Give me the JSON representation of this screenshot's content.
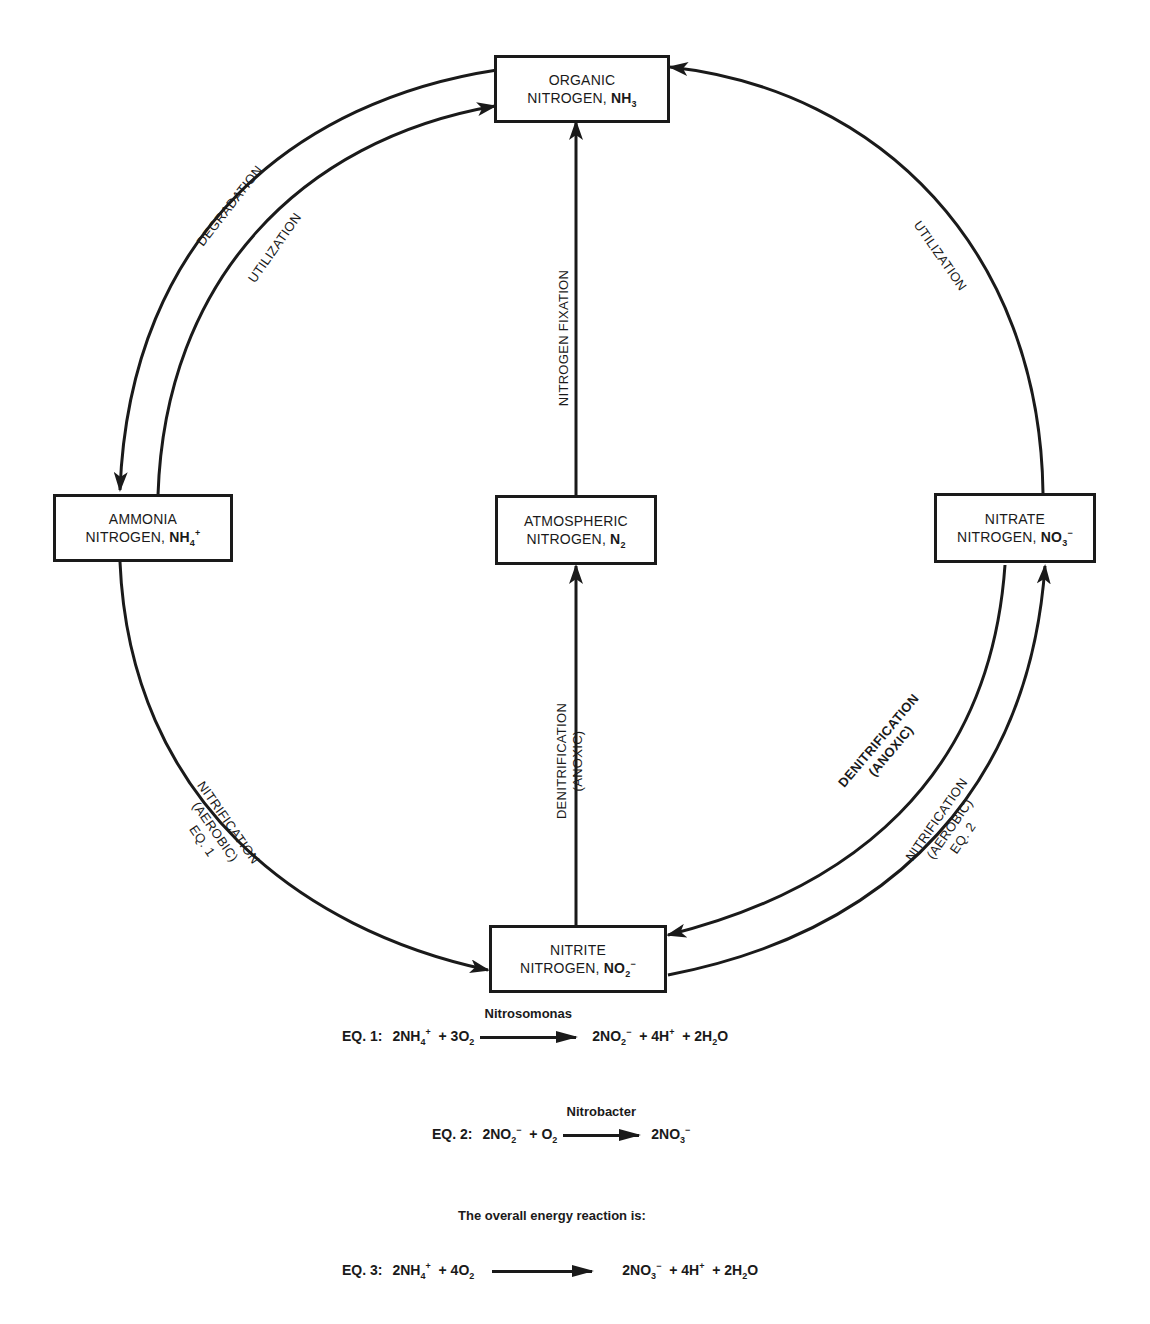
{
  "nodes": {
    "organic": {
      "line1": "ORGANIC",
      "line2_prefix": "NITROGEN, ",
      "formula": "NH",
      "sub": "3",
      "sup": ""
    },
    "ammonia": {
      "line1": "AMMONIA",
      "line2_prefix": "NITROGEN, ",
      "formula": "NH",
      "sub": "4",
      "sup": "+"
    },
    "atmospheric": {
      "line1": "ATMOSPHERIC",
      "line2_prefix": "NITROGEN, ",
      "formula": "N",
      "sub": "2",
      "sup": ""
    },
    "nitrate": {
      "line1": "NITRATE",
      "line2_prefix": "NITROGEN, ",
      "formula": "NO",
      "sub": "3",
      "sup": "−"
    },
    "nitrite": {
      "line1": "NITRITE",
      "line2_prefix": "NITROGEN, ",
      "formula": "NO",
      "sub": "2",
      "sup": "−"
    }
  },
  "edges": {
    "degradation": {
      "label": "DEGRADATION",
      "from": "ORGANIC NITROGEN",
      "to": "AMMONIA NITROGEN"
    },
    "utilization_left": {
      "label": "UTILIZATION",
      "from": "AMMONIA NITROGEN",
      "to": "ORGANIC NITROGEN"
    },
    "utilization_right": {
      "label": "UTILIZATION",
      "from": "NITRATE NITROGEN",
      "to": "ORGANIC NITROGEN"
    },
    "nitrogen_fixation": {
      "label": "NITROGEN FIXATION",
      "from": "ATMOSPHERIC NITROGEN",
      "to": "ORGANIC NITROGEN"
    },
    "denitrification_center": {
      "line1": "DENITRIFICATION",
      "line2": "(ANOXIC)",
      "from": "NITRITE NITROGEN",
      "to": "ATMOSPHERIC NITROGEN"
    },
    "nitrification_left": {
      "line1": "NITRIFICATION",
      "line2": "(AEROBIC)",
      "line3": "EQ. 1",
      "from": "AMMONIA NITROGEN",
      "to": "NITRITE NITROGEN"
    },
    "denitrification_right": {
      "line1": "DENITRIFICATION",
      "line2": "(ANOXIC)",
      "from": "NITRATE NITROGEN",
      "to": "NITRITE NITROGEN"
    },
    "nitrification_right": {
      "line1": "NITRIFICATION",
      "line2": "(AEROBIC)",
      "line3": "EQ. 2",
      "from": "NITRITE NITROGEN",
      "to": "NITRATE NITROGEN"
    }
  },
  "equations": {
    "eq1": {
      "label": "EQ. 1:",
      "organism": "Nitrosomonas",
      "lhs": [
        {
          "t": "2NH",
          "sub": "4",
          "sup": "+"
        },
        {
          "t": " + 3O",
          "sub": "2",
          "sup": ""
        }
      ],
      "rhs": [
        {
          "t": "2NO",
          "sub": "2",
          "sup": "−"
        },
        {
          "t": " + 4H",
          "sub": "",
          "sup": "+"
        },
        {
          "t": " + 2H",
          "sub": "2",
          "sup": ""
        },
        {
          "t": "O",
          "sub": "",
          "sup": ""
        }
      ]
    },
    "eq2": {
      "label": "EQ. 2:",
      "organism": "Nitrobacter",
      "lhs": [
        {
          "t": "2NO",
          "sub": "2",
          "sup": "−"
        },
        {
          "t": " + O",
          "sub": "2",
          "sup": ""
        }
      ],
      "rhs": [
        {
          "t": "2NO",
          "sub": "3",
          "sup": "−"
        }
      ]
    },
    "caption": "The overall energy reaction is:",
    "eq3": {
      "label": "EQ. 3:",
      "organism": "",
      "lhs": [
        {
          "t": "2NH",
          "sub": "4",
          "sup": "+"
        },
        {
          "t": " + 4O",
          "sub": "2",
          "sup": ""
        }
      ],
      "rhs": [
        {
          "t": "2NO",
          "sub": "3",
          "sup": "−"
        },
        {
          "t": " + 4H",
          "sub": "",
          "sup": "+"
        },
        {
          "t": " + 2H",
          "sub": "2",
          "sup": ""
        },
        {
          "t": "O",
          "sub": "",
          "sup": ""
        }
      ]
    }
  },
  "colors": {
    "ink": "#1a1a1a",
    "background": "#ffffff"
  }
}
